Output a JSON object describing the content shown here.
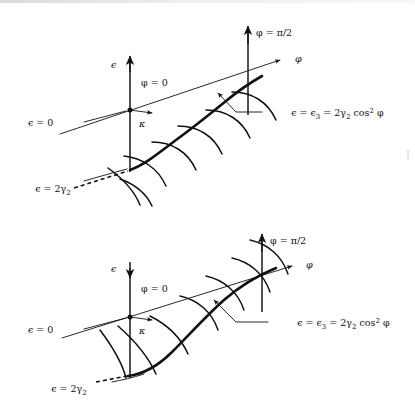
{
  "figure": {
    "background_color": "#ffffff",
    "ink_color": "#111111"
  },
  "panels": [
    {
      "id": "upper",
      "name": "upper-diagram",
      "epsilon_axis_label": "ϵ",
      "epsilon_arrow_direction": "up",
      "phi_zero_label": "φ = 0",
      "phi_half_pi_label": "φ = π/2",
      "phi_axis_label": "φ",
      "kappa_label": "κ",
      "epsilon_zero_label": "ϵ = 0",
      "epsilon_two_gamma_label_parts": {
        "lead": "ϵ = 2γ",
        "sub": "2"
      },
      "epsilon_three_label_parts": {
        "a": "ϵ = ϵ",
        "a_sub": "3",
        "b": " = 2γ",
        "b_sub": "2",
        "c": " cos",
        "c_sup": "2",
        "d": " φ"
      },
      "curve_style": "cusped-at-origin",
      "dashed_tail": true
    },
    {
      "id": "lower",
      "name": "lower-diagram",
      "epsilon_axis_label": "ϵ",
      "epsilon_arrow_direction": "down",
      "phi_zero_label": "φ = 0",
      "phi_half_pi_label": "φ = π/2",
      "phi_axis_label": "φ",
      "kappa_label": "κ",
      "epsilon_zero_label": "ϵ = 0",
      "epsilon_two_gamma_label_parts": {
        "lead": "ϵ = 2γ",
        "sub": "2"
      },
      "epsilon_three_label_parts": {
        "a": "ϵ = ϵ",
        "a_sub": "3",
        "b": " = 2γ",
        "b_sub": "2",
        "c": " cos",
        "c_sup": "2",
        "d": " φ"
      },
      "curve_style": "smooth-u",
      "dashed_tail": true
    }
  ]
}
